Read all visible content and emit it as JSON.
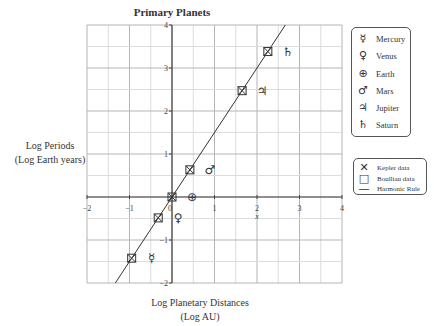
{
  "chart_data": {
    "type": "scatter",
    "title": "Primary Planets",
    "xlabel": "Log Planetary Distances\n(Log AU)",
    "xlabel_lines": [
      "Log Planetary Distances",
      "(Log AU)"
    ],
    "ylabel_lines": [
      "Log Periods",
      "(Log Earth years)"
    ],
    "xlim": [
      -2,
      4
    ],
    "ylim": [
      -2,
      4
    ],
    "x_ticks": [
      "-2",
      "-1",
      "0",
      "1",
      "2",
      "3",
      "4"
    ],
    "y_ticks": [
      "-2",
      "-1",
      "1",
      "2",
      "3",
      "4"
    ],
    "x_axis_variable": "x",
    "grid": true,
    "grid_minor_step": 0.5,
    "legend_position": "right",
    "planets": [
      {
        "name": "Mercury",
        "symbol": "☿",
        "x": -0.949,
        "y": -1.423
      },
      {
        "name": "Venus",
        "symbol": "♀",
        "x": -0.324,
        "y": -0.486
      },
      {
        "name": "Earth",
        "symbol": "⊕",
        "x": 0.0,
        "y": 0.0
      },
      {
        "name": "Mars",
        "symbol": "♂",
        "x": 0.421,
        "y": 0.632
      },
      {
        "name": "Jupiter",
        "symbol": "♃",
        "x": 1.649,
        "y": 2.473
      },
      {
        "name": "Saturn",
        "symbol": "♄",
        "x": 2.255,
        "y": 3.383
      }
    ],
    "series": [
      {
        "name": "Kepler data",
        "marker": "x",
        "x": [
          -0.949,
          -0.324,
          0.0,
          0.421,
          1.649,
          2.255
        ],
        "y": [
          -1.423,
          -0.486,
          0.0,
          0.632,
          2.473,
          3.383
        ]
      },
      {
        "name": "Boulliau data",
        "marker": "square",
        "x": [
          -0.949,
          -0.324,
          0.0,
          0.421,
          1.649,
          2.255
        ],
        "y": [
          -1.423,
          -0.486,
          0.0,
          0.632,
          2.473,
          3.383
        ]
      },
      {
        "name": "Harmonic Rule",
        "type": "line",
        "equation": "y = 1.5x",
        "slope": 1.5,
        "intercept": 0
      }
    ],
    "legend_planets": [
      "Mercury",
      "Venus",
      "Earth",
      "Mars",
      "Jupiter",
      "Saturn"
    ],
    "legend_data": [
      "Kepler data",
      "Boulliau data",
      "Harmonic Rule"
    ]
  },
  "title": "Primary Planets",
  "ylabel": {
    "line1": "Log Periods",
    "line2": "(Log Earth years)"
  },
  "xlabel": {
    "line1": "Log Planetary Distances",
    "line2": "(Log AU)"
  },
  "legend_planets": [
    {
      "symbol": "☿",
      "label": "Mercury"
    },
    {
      "symbol": "♀",
      "label": "Venus"
    },
    {
      "symbol": "⊕",
      "label": "Earth"
    },
    {
      "symbol": "♂",
      "label": "Mars"
    },
    {
      "symbol": "♃",
      "label": "Jupiter"
    },
    {
      "symbol": "♄",
      "label": "Saturn"
    }
  ],
  "legend_data": [
    {
      "symbol": "✕",
      "label": "Kepler data"
    },
    {
      "symbol": "□",
      "label": "Boulliau data"
    },
    {
      "symbol": "—",
      "label": "Harmonic Rule"
    }
  ],
  "colors": {
    "grid_minor": "#dcdcdc",
    "grid_major": "#b5b5b5",
    "axis": "#444444",
    "line": "#333333"
  }
}
